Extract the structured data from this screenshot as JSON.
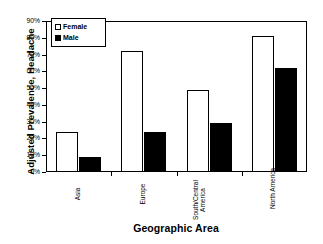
{
  "chart_data": {
    "type": "bar",
    "title": "",
    "xlabel": "Geographic Area",
    "ylabel": "Adjusted Prevalence, Headache",
    "categories": [
      "Asia",
      "Europe",
      "South/Central America",
      "North America"
    ],
    "series": [
      {
        "name": "Female",
        "values": [
          24,
          72,
          49,
          81
        ],
        "fill": "#ffffff",
        "stroke": "#000000"
      },
      {
        "name": "Male",
        "values": [
          9,
          24,
          29,
          62
        ],
        "fill": "#000000",
        "stroke": "#000000"
      }
    ],
    "ylim": [
      0,
      90
    ],
    "ytick_values": [
      0,
      10,
      20,
      30,
      40,
      50,
      60,
      70,
      80,
      90
    ],
    "ytick_labels": [
      "0%",
      "10%",
      "20%",
      "30%",
      "40%",
      "50%",
      "60%",
      "70%",
      "80%",
      "90%"
    ],
    "grid": false,
    "legend_position": "upper-left-inside",
    "units": "percent"
  },
  "legend": {
    "items": [
      {
        "label": "Female",
        "marker": "hollow-square"
      },
      {
        "label": "Male",
        "marker": "filled-square"
      }
    ]
  },
  "axes": {
    "y_title": "Adjusted Prevalence, Headache",
    "x_title": "Geographic Area",
    "category_labels": [
      {
        "text": "Asia",
        "lines": [
          "Asia"
        ]
      },
      {
        "text": "Europe",
        "lines": [
          "Europe"
        ]
      },
      {
        "text": "South/Central America",
        "lines": [
          "South/Central",
          "America"
        ]
      },
      {
        "text": "North America",
        "lines": [
          "North America"
        ]
      }
    ]
  }
}
